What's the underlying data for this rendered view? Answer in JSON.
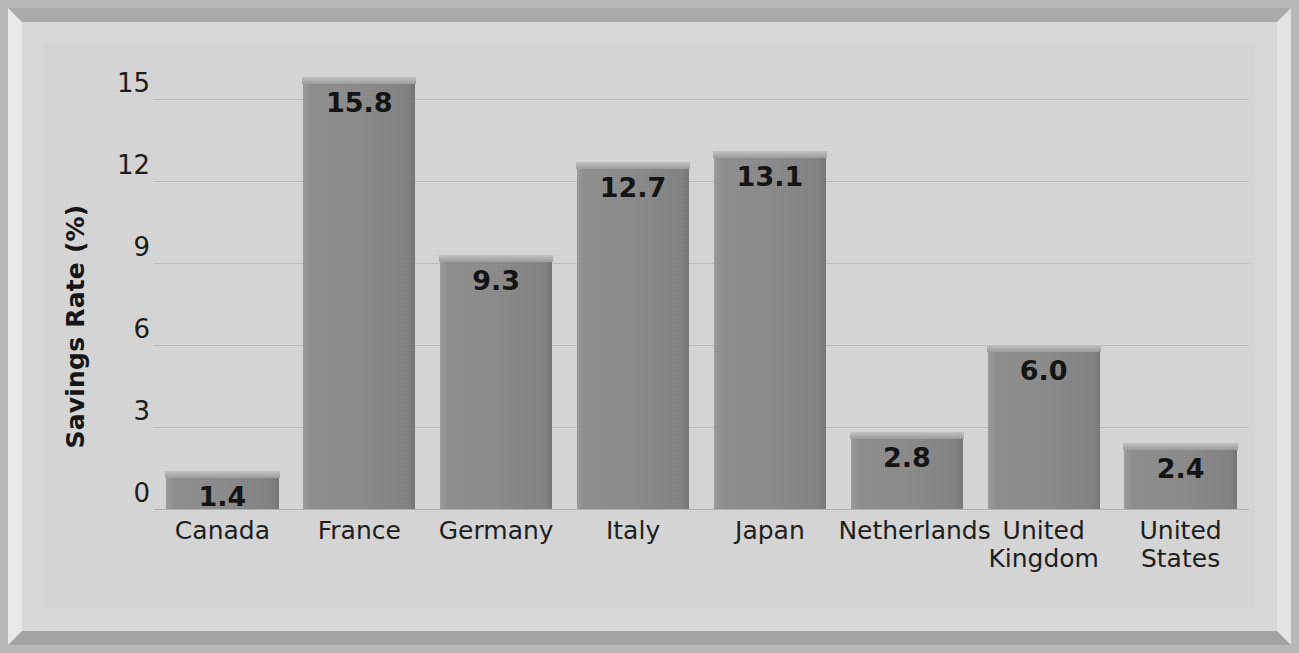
{
  "chart_data": {
    "type": "bar",
    "title": "",
    "subtitle": "",
    "xlabel": "",
    "ylabel": "Savings Rate (%)",
    "categories": [
      "Canada",
      "France",
      "Germany",
      "Italy",
      "Japan",
      "Netherlands",
      "United Kingdom",
      "United States"
    ],
    "category_display": [
      "Canada",
      "France",
      "Germany",
      "Italy",
      "Japan",
      "Netherlands",
      "United\nKingdom",
      "United\nStates"
    ],
    "values": [
      1.4,
      15.8,
      9.3,
      12.7,
      13.1,
      2.8,
      6.0,
      2.4
    ],
    "value_labels": [
      "1.4",
      "15.8",
      "9.3",
      "12.7",
      "13.1",
      "2.8",
      "6.0",
      "2.4"
    ],
    "ylim": [
      0,
      16.5
    ],
    "yticks": [
      0,
      3,
      6,
      9,
      12,
      15
    ],
    "ytick_labels": [
      "0",
      "3",
      "6",
      "9",
      "12",
      "15"
    ],
    "grid": true,
    "grid_axis": "y",
    "legend": false,
    "legend_position": "none",
    "bar_color": "#8a8a8a",
    "plot_background": "#d6d6d6",
    "frame_background": "#b8b8b8",
    "gridline_color": "#bdbdbd",
    "text_color": "#151515",
    "value_label_position": "inside-top"
  }
}
